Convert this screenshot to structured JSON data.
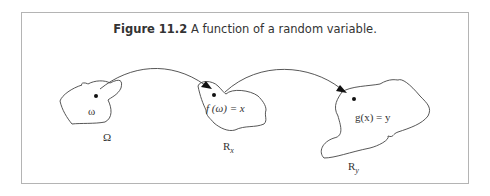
{
  "figure": {
    "caption_number": "Figure 11.2",
    "caption_text": " A function of a random variable."
  },
  "labels": {
    "omega_point": "ω",
    "omega_set": "Ω",
    "f_mapping": "f (ω)  = x",
    "rx_set": "R",
    "rx_sub": "x",
    "g_mapping": "g(x)  = y",
    "ry_set": "R",
    "ry_sub": "y"
  }
}
